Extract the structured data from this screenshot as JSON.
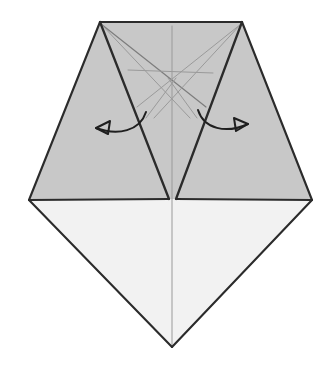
{
  "figure": {
    "canvas": {
      "width": 326,
      "height": 368
    },
    "background_color": "#ffffff"
  },
  "colors": {
    "shaded_face": "#c8c8c8",
    "light_face": "#f2f2f2",
    "outline": "#2b2b2b",
    "crease": "#9a9a9a",
    "arrow": "#1f1f1f"
  },
  "strokes": {
    "outline_width": 2.1,
    "inner_outline_width": 2.3,
    "crease_width": 1.0,
    "arrow_width": 2.0
  },
  "geometry": {
    "vertices": {
      "top_left": {
        "x": 100,
        "y": 22
      },
      "top_right": {
        "x": 242,
        "y": 22
      },
      "left_corner": {
        "x": 29,
        "y": 200
      },
      "right_corner": {
        "x": 312,
        "y": 200
      },
      "bottom_apex": {
        "x": 172,
        "y": 347
      },
      "notch_bottom": {
        "x": 172,
        "y": 199
      },
      "notch_left": {
        "x": 169,
        "y": 199
      },
      "notch_right": {
        "x": 176,
        "y": 199
      },
      "center_axis_top": {
        "x": 172,
        "y": 26
      },
      "center_axis_bottom": {
        "x": 172,
        "y": 345
      }
    },
    "faces": {
      "left_flap": "100,22 169,199 29,200",
      "right_flap": "242,22 312,200 176,199",
      "upper_center_wedge": "100,22 242,22 176,199 172,199 169,199",
      "lower_diamond": "29,200 172,199 312,200 172,347"
    },
    "outline_edges": [
      {
        "name": "top-edge",
        "d": "M100,22 L242,22"
      },
      {
        "name": "upper-left-edge",
        "d": "M100,22 L29,200"
      },
      {
        "name": "upper-right-edge",
        "d": "M242,22 L312,200"
      },
      {
        "name": "left-base-edge",
        "d": "M29,200 L169,199"
      },
      {
        "name": "right-base-edge",
        "d": "M176,199 L312,200"
      },
      {
        "name": "lower-left-edge",
        "d": "M29,200 L172,347"
      },
      {
        "name": "lower-right-edge",
        "d": "M312,200 L172,347"
      },
      {
        "name": "notch-left-fold",
        "d": "M100,22 L169,199"
      },
      {
        "name": "notch-right-fold",
        "d": "M242,22 L176,199"
      }
    ],
    "crease_lines": [
      {
        "name": "center-vertical-crease",
        "d": "M172,26 L172,345"
      },
      {
        "name": "crease-top-left-to-mid-right",
        "d": "M101,24 L206,107"
      },
      {
        "name": "crease-top-right-to-mid-left",
        "d": "M241,24 L137,107"
      },
      {
        "name": "crease-top-left-diagonal",
        "d": "M101,24 L190,118"
      },
      {
        "name": "crease-top-right-diagonal",
        "d": "M241,24 L154,118"
      },
      {
        "name": "crease-horizontal-band",
        "d": "M128,70 L213,73"
      },
      {
        "name": "crease-lower-left-v",
        "d": "M146,118 L176,78"
      },
      {
        "name": "crease-lower-right-v",
        "d": "M197,118 L168,78"
      }
    ],
    "arrows": [
      {
        "name": "left-unfold-arrow",
        "direction": "left",
        "path": "M146,112 C140,131 118,136 96,128",
        "head": "96,128 110,121 108,134"
      },
      {
        "name": "right-unfold-arrow",
        "direction": "right",
        "path": "M198,110 C204,129 226,134 248,124",
        "head": "248,124 234,118 236,131"
      }
    ]
  }
}
